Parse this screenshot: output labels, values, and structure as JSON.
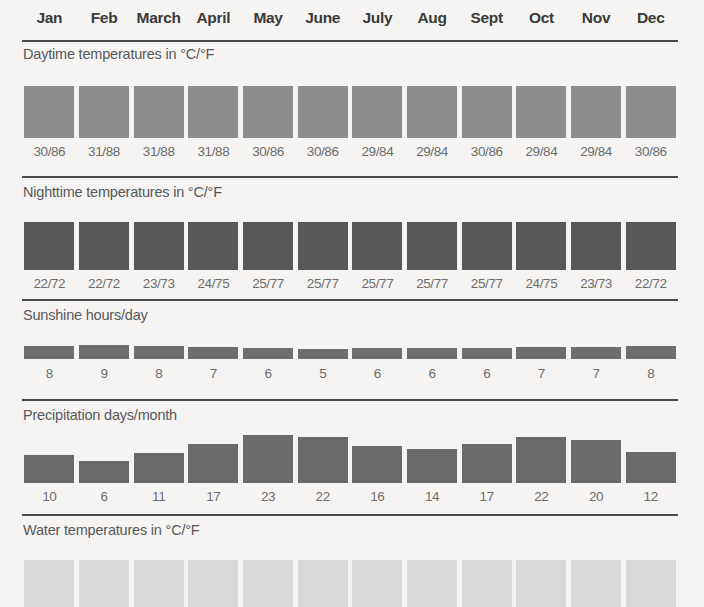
{
  "months": [
    "Jan",
    "Feb",
    "March",
    "April",
    "May",
    "June",
    "July",
    "Aug",
    "Sept",
    "Oct",
    "Nov",
    "Dec"
  ],
  "sections": {
    "daytime": {
      "label": "Daytime temperatures in °C/°F"
    },
    "nighttime": {
      "label": "Nighttime temperatures in °C/°F"
    },
    "sunshine": {
      "label": "Sunshine hours/day"
    },
    "precipitation": {
      "label": "Precipitation days/month"
    },
    "water": {
      "label": "Water temperatures in °C/°F"
    }
  },
  "colors": {
    "background": "#f5f4f2",
    "rule": "#4a4a4a",
    "header_text": "#3a3a3a",
    "label_text": "#58585a",
    "value_text": "#6d6d6d",
    "daytime_bar": "#8d8d8d",
    "nighttime_bar": "#585858",
    "sunshine_bar": "#6e6e6e",
    "precipitation_bar": "#6a6a6a",
    "water_bar": "#d9d9d9"
  },
  "chart_data": [
    {
      "type": "bar",
      "title": "Daytime temperatures in °C/°F",
      "xlabel": "",
      "ylabel": "°C/°F",
      "categories": [
        "Jan",
        "Feb",
        "March",
        "April",
        "May",
        "June",
        "July",
        "Aug",
        "Sept",
        "Oct",
        "Nov",
        "Dec"
      ],
      "values": [
        30,
        31,
        31,
        31,
        30,
        30,
        29,
        29,
        30,
        29,
        29,
        30
      ],
      "values_fahrenheit": [
        86,
        88,
        88,
        88,
        86,
        86,
        84,
        84,
        86,
        84,
        84,
        86
      ],
      "labels": [
        "30/86",
        "31/88",
        "31/88",
        "31/88",
        "30/86",
        "30/86",
        "29/84",
        "29/84",
        "30/86",
        "29/84",
        "29/84",
        "30/86"
      ]
    },
    {
      "type": "bar",
      "title": "Nighttime temperatures in °C/°F",
      "xlabel": "",
      "ylabel": "°C/°F",
      "categories": [
        "Jan",
        "Feb",
        "March",
        "April",
        "May",
        "June",
        "July",
        "Aug",
        "Sept",
        "Oct",
        "Nov",
        "Dec"
      ],
      "values": [
        22,
        22,
        23,
        24,
        25,
        25,
        25,
        25,
        25,
        24,
        23,
        22
      ],
      "values_fahrenheit": [
        72,
        72,
        73,
        75,
        77,
        77,
        77,
        77,
        77,
        75,
        73,
        72
      ],
      "labels": [
        "22/72",
        "22/72",
        "23/73",
        "24/75",
        "25/77",
        "25/77",
        "25/77",
        "25/77",
        "25/77",
        "24/75",
        "23/73",
        "22/72"
      ]
    },
    {
      "type": "bar",
      "title": "Sunshine hours/day",
      "xlabel": "",
      "ylabel": "hours/day",
      "categories": [
        "Jan",
        "Feb",
        "March",
        "April",
        "May",
        "June",
        "July",
        "Aug",
        "Sept",
        "Oct",
        "Nov",
        "Dec"
      ],
      "values": [
        8,
        9,
        8,
        7,
        6,
        5,
        6,
        6,
        6,
        7,
        7,
        8
      ],
      "labels": [
        "8",
        "9",
        "8",
        "7",
        "6",
        "5",
        "6",
        "6",
        "6",
        "7",
        "7",
        "8"
      ]
    },
    {
      "type": "bar",
      "title": "Precipitation days/month",
      "xlabel": "",
      "ylabel": "days/month",
      "categories": [
        "Jan",
        "Feb",
        "March",
        "April",
        "May",
        "June",
        "July",
        "Aug",
        "Sept",
        "Oct",
        "Nov",
        "Dec"
      ],
      "values": [
        10,
        6,
        11,
        17,
        23,
        22,
        16,
        14,
        17,
        22,
        20,
        12
      ],
      "labels": [
        "10",
        "6",
        "11",
        "17",
        "23",
        "22",
        "16",
        "14",
        "17",
        "22",
        "20",
        "12"
      ]
    },
    {
      "type": "bar",
      "title": "Water temperatures in °C/°F",
      "xlabel": "",
      "ylabel": "°C/°F",
      "categories": [
        "Jan",
        "Feb",
        "March",
        "April",
        "May",
        "June",
        "July",
        "Aug",
        "Sept",
        "Oct",
        "Nov",
        "Dec"
      ],
      "values": [
        null,
        null,
        null,
        null,
        null,
        null,
        null,
        null,
        null,
        null,
        null,
        null
      ],
      "labels": [],
      "note": "row cropped at bottom edge of screenshot; values not visible"
    }
  ]
}
